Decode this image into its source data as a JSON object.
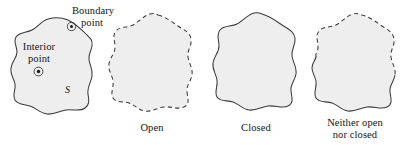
{
  "figure": {
    "kind": "topology-open-closed-sets-illustration",
    "width_px": 401,
    "height_px": 145,
    "background_color": "#ffffff",
    "region_fill_color": "#eeeeee",
    "outline_color": "#3b3b3b",
    "text_color": "#141414"
  },
  "annotations": {
    "boundary_point_label_line1": "Boundary",
    "boundary_point_label_line2": "point",
    "interior_point_label_line1": "Interior",
    "interior_point_label_line2": "point",
    "set_label": "S"
  },
  "panels": [
    {
      "id": "panel-set-s",
      "caption": "",
      "boundary_style": "solid",
      "has_markers": true
    },
    {
      "id": "panel-open",
      "caption": "Open",
      "boundary_style": "dashed",
      "has_markers": false
    },
    {
      "id": "panel-closed",
      "caption": "Closed",
      "boundary_style": "solid",
      "has_markers": false
    },
    {
      "id": "panel-neither",
      "caption_line1": "Neither open",
      "caption_line2": "nor closed",
      "boundary_style": "mixed",
      "has_markers": false
    }
  ]
}
